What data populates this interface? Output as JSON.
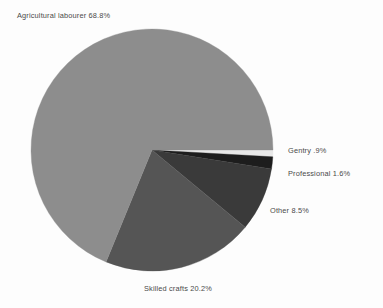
{
  "chart_data": {
    "type": "pie",
    "title": "",
    "subtitle": "",
    "xlabel": "",
    "ylabel": "",
    "legend_position": "none",
    "grid": false,
    "start_angle_deg": 0,
    "direction": "clockwise",
    "categories": [
      "Gentry",
      "Professional",
      "Other",
      "Skilled crafts",
      "Agricultural labourer"
    ],
    "values": [
      0.9,
      1.6,
      8.5,
      20.2,
      68.8
    ],
    "units": "percent",
    "slices": [
      {
        "name": "Gentry",
        "value": 0.9,
        "label": "Gentry .9%",
        "color": "#e8e8e8",
        "label_position": "right"
      },
      {
        "name": "Professional",
        "value": 1.6,
        "label": "Professional 1.6%",
        "color": "#1d1d1d",
        "label_position": "right"
      },
      {
        "name": "Other",
        "value": 8.5,
        "label": "Other 8.5%",
        "color": "#3a3a3a",
        "label_position": "right"
      },
      {
        "name": "Skilled crafts",
        "value": 20.2,
        "label": "Skilled crafts 20.2%",
        "color": "#555555",
        "label_position": "bottom"
      },
      {
        "name": "Agricultural labourer",
        "value": 68.8,
        "label": "Agricultural labourer 68.8%",
        "color": "#8d8d8d",
        "label_position": "top-left"
      }
    ],
    "geometry": {
      "center_x": 152,
      "center_y": 150,
      "radius": 121
    },
    "background_color": "#fdfdfd",
    "label_text_color": "#4a4a4a"
  }
}
